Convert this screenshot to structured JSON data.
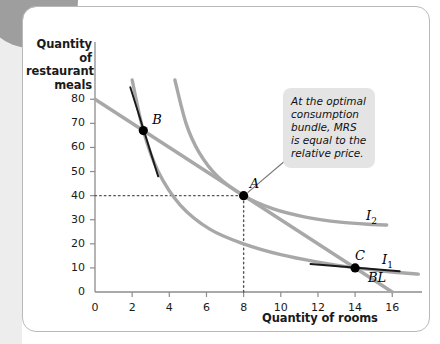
{
  "chart_data": {
    "type": "line",
    "title": "",
    "xlabel": "Quantity of rooms",
    "ylabel": "Quantity of restaurant meals",
    "xlim": [
      0,
      17.6
    ],
    "ylim": [
      0,
      88
    ],
    "xticks": [
      0,
      2,
      4,
      6,
      8,
      10,
      12,
      14,
      16
    ],
    "yticks": [
      0,
      10,
      20,
      30,
      40,
      50,
      60,
      70,
      80
    ],
    "grid": false,
    "legend": "inline-curve-labels",
    "series": [
      {
        "name": "BL",
        "label": "BL",
        "type": "budget-line",
        "color": "#a8a8a8",
        "points": [
          [
            0,
            80
          ],
          [
            16,
            0
          ]
        ]
      },
      {
        "name": "I1",
        "label": "I₁",
        "type": "indifference-curve",
        "color": "#a8a8a8",
        "points": [
          [
            2.0,
            88
          ],
          [
            2.6,
            67
          ],
          [
            3.4,
            50
          ],
          [
            4.6,
            36
          ],
          [
            6.2,
            26
          ],
          [
            8.0,
            20
          ],
          [
            10.0,
            15.5
          ],
          [
            12.0,
            12.4
          ],
          [
            14.0,
            10.0
          ],
          [
            16.0,
            8.3
          ],
          [
            17.4,
            7.4
          ]
        ]
      },
      {
        "name": "I2",
        "label": "I₂",
        "type": "indifference-curve",
        "color": "#a8a8a8",
        "points": [
          [
            4.3,
            88
          ],
          [
            4.9,
            70
          ],
          [
            5.6,
            58
          ],
          [
            6.6,
            48
          ],
          [
            8.0,
            40
          ],
          [
            9.6,
            34.5
          ],
          [
            11.4,
            31
          ],
          [
            13.2,
            29
          ],
          [
            15.0,
            28
          ],
          [
            15.7,
            27.8
          ]
        ]
      }
    ],
    "points": [
      {
        "label": "A",
        "x": 8,
        "y": 40,
        "filled": true
      },
      {
        "label": "B",
        "x": 2.6,
        "y": 67,
        "filled": true
      },
      {
        "label": "C",
        "x": 14,
        "y": 10,
        "filled": true
      }
    ],
    "tangent_lines": [
      {
        "name": "tangent-at-B",
        "color": "#1a1a1a",
        "points": [
          [
            1.9,
            85
          ],
          [
            3.4,
            48
          ]
        ]
      },
      {
        "name": "tangent-at-C",
        "color": "#1a1a1a",
        "points": [
          [
            11.6,
            11.6
          ],
          [
            16.4,
            8.6
          ]
        ]
      }
    ],
    "dotted_guides": [
      {
        "name": "guide-horizontal-40",
        "from": [
          0,
          40
        ],
        "to": [
          8,
          40
        ]
      },
      {
        "name": "guide-vertical-8",
        "from": [
          8,
          0
        ],
        "to": [
          8,
          40
        ]
      }
    ],
    "annotations": [
      {
        "name": "optimal-bundle-callout",
        "text": "At the optimal consumption bundle, MRS is equal to the relative price.",
        "target_point": "A"
      }
    ]
  },
  "axis": {
    "y_title": "Quantity of restaurant meals",
    "x_title": "Quantity of rooms"
  },
  "labels": {
    "point_a": "A",
    "point_b": "B",
    "point_c": "C",
    "curve_i1": "I",
    "curve_i1_sub": "1",
    "curve_i2": "I",
    "curve_i2_sub": "2",
    "budget_line": "BL"
  },
  "colors": {
    "curve": "#a8a8a8",
    "tangent": "#1a1a1a",
    "axis": "#8d8d8d",
    "text": "#1a1a1a",
    "callout_bg": "#e4e4e4",
    "frame": "#b9b9b9",
    "corner_disc": "#9e9e9e",
    "left_strip": "#ededed"
  }
}
